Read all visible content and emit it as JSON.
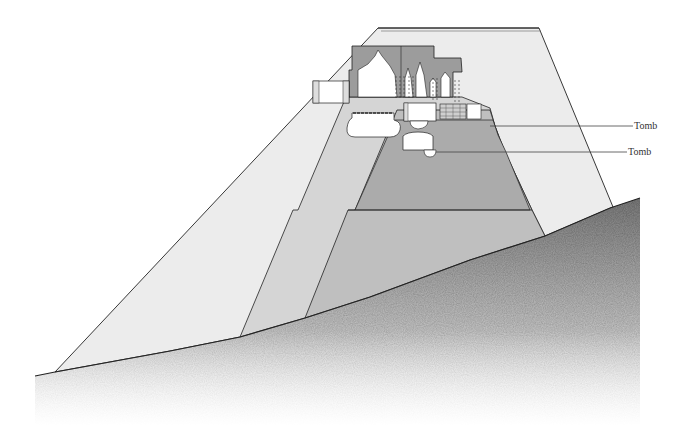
{
  "diagram": {
    "type": "cross-section",
    "labels": [
      {
        "text": "Tomb",
        "x": 634,
        "y": 121
      },
      {
        "text": "Tomb",
        "x": 628,
        "y": 147
      }
    ],
    "colors": {
      "outer_layer": "#ececec",
      "middle_layer": "#d6d6d6",
      "inner_layer": "#bdbdbd",
      "core_layer": "#a9a9a9",
      "temple_fill": "#9c9c9c",
      "chamber_fill": "#ffffff",
      "ground": "#8a8a8a",
      "outline": "#222222"
    }
  }
}
